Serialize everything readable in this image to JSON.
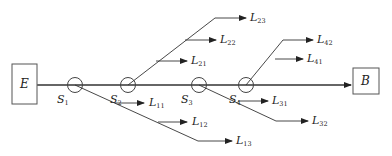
{
  "diagram": {
    "source_node": {
      "label": "E"
    },
    "sink_node": {
      "label": "B"
    },
    "switches": [
      {
        "id": "S1",
        "label": "S",
        "sub": "1"
      },
      {
        "id": "S2",
        "label": "S",
        "sub": "2"
      },
      {
        "id": "S3",
        "label": "S",
        "sub": "3"
      },
      {
        "id": "S4",
        "label": "S",
        "sub": "4"
      }
    ],
    "loads": [
      {
        "id": "L11",
        "label": "L",
        "sub": "11"
      },
      {
        "id": "L12",
        "label": "L",
        "sub": "12"
      },
      {
        "id": "L13",
        "label": "L",
        "sub": "13"
      },
      {
        "id": "L21",
        "label": "L",
        "sub": "21"
      },
      {
        "id": "L22",
        "label": "L",
        "sub": "22"
      },
      {
        "id": "L23",
        "label": "L",
        "sub": "23"
      },
      {
        "id": "L31",
        "label": "L",
        "sub": "31"
      },
      {
        "id": "L32",
        "label": "L",
        "sub": "32"
      },
      {
        "id": "L41",
        "label": "L",
        "sub": "41"
      },
      {
        "id": "L42",
        "label": "L",
        "sub": "42"
      }
    ],
    "colors": {
      "line": "#333333",
      "main_line": "#555555",
      "background": "#ffffff"
    }
  }
}
